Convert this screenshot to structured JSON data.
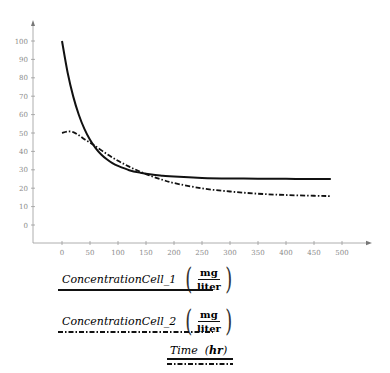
{
  "chart_data": {
    "type": "line",
    "title": "",
    "xlabel": "Time",
    "xlabel_unit": "hr",
    "ylabel": "",
    "xlim": [
      -50,
      550
    ],
    "ylim": [
      -10,
      105
    ],
    "x_ticks": [
      0,
      50,
      100,
      150,
      200,
      250,
      300,
      350,
      400,
      450,
      500
    ],
    "y_ticks": [
      0,
      10,
      20,
      30,
      40,
      50,
      60,
      70,
      80,
      90,
      100
    ],
    "grid": false,
    "legend_position": "bottom-left",
    "series": [
      {
        "name": "ConcentrationCell_1",
        "unit_num": "mg",
        "unit_den": "liter",
        "style": "solid",
        "color": "#111111",
        "x": [
          0,
          10,
          20,
          30,
          40,
          50,
          60,
          70,
          80,
          90,
          100,
          120,
          140,
          160,
          180,
          200,
          250,
          300,
          350,
          400,
          450,
          480
        ],
        "y": [
          100,
          82.9,
          69.9,
          59.9,
          52.2,
          46.3,
          41.8,
          38.3,
          35.7,
          33.6,
          32.1,
          29.8,
          28.4,
          27.4,
          26.8,
          26.3,
          25.6,
          25.3,
          25.2,
          25.1,
          25.0,
          25.0
        ]
      },
      {
        "name": "ConcentrationCell_2",
        "unit_num": "mg",
        "unit_den": "liter",
        "style": "dashdot",
        "color": "#111111",
        "x": [
          0,
          10,
          20,
          30,
          40,
          50,
          60,
          80,
          100,
          120,
          140,
          160,
          180,
          200,
          250,
          300,
          350,
          400,
          450,
          480
        ],
        "y": [
          50,
          50.8,
          50.5,
          48.8,
          46.6,
          44.8,
          42.8,
          38.6,
          34.9,
          31.7,
          28.9,
          26.5,
          24.5,
          22.8,
          19.9,
          18.2,
          17.0,
          16.3,
          15.9,
          15.7
        ]
      }
    ]
  },
  "legend": {
    "items": [
      {
        "name": "ConcentrationCell_1",
        "unit_num": "mg",
        "unit_den": "liter"
      },
      {
        "name": "ConcentrationCell_2",
        "unit_num": "mg",
        "unit_den": "liter"
      }
    ],
    "xaxis": {
      "name": "Time",
      "unit": "hr"
    }
  }
}
